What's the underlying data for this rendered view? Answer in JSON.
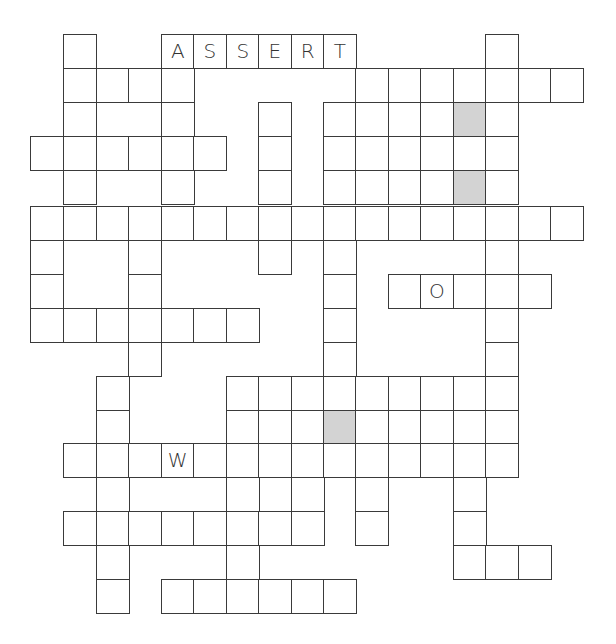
{
  "puzzle": {
    "type": "crossword",
    "columns_x": [
      30,
      63,
      96,
      128,
      161,
      193,
      226,
      258,
      291,
      323,
      355,
      388,
      420,
      453,
      485,
      518,
      550
    ],
    "rows_y": [
      34,
      68,
      102,
      136,
      170,
      206,
      240,
      274,
      308,
      342,
      376,
      410,
      443,
      477,
      511,
      545,
      579
    ],
    "cell_width": 33.5,
    "cell_height": 34.5,
    "shaded_color": "#d3d3d3",
    "border_color": "#3a3a3a",
    "rows": [
      {
        "r": 0,
        "cells": [
          {
            "c": 1
          },
          {
            "c": 4,
            "letter": "A"
          },
          {
            "c": 5,
            "letter": "S"
          },
          {
            "c": 6,
            "letter": "S"
          },
          {
            "c": 7,
            "letter": "E"
          },
          {
            "c": 8,
            "letter": "R"
          },
          {
            "c": 9,
            "letter": "T"
          },
          {
            "c": 14
          }
        ]
      },
      {
        "r": 1,
        "cells": [
          {
            "c": 1
          },
          {
            "c": 2
          },
          {
            "c": 3
          },
          {
            "c": 4
          },
          {
            "c": 10
          },
          {
            "c": 11
          },
          {
            "c": 12
          },
          {
            "c": 13
          },
          {
            "c": 14
          },
          {
            "c": 15
          },
          {
            "c": 16
          }
        ]
      },
      {
        "r": 2,
        "cells": [
          {
            "c": 1
          },
          {
            "c": 4
          },
          {
            "c": 7
          },
          {
            "c": 9
          },
          {
            "c": 10
          },
          {
            "c": 11
          },
          {
            "c": 12
          },
          {
            "c": 13,
            "shaded": true
          },
          {
            "c": 14
          }
        ]
      },
      {
        "r": 3,
        "cells": [
          {
            "c": 0
          },
          {
            "c": 1
          },
          {
            "c": 2
          },
          {
            "c": 3
          },
          {
            "c": 4
          },
          {
            "c": 5
          },
          {
            "c": 7
          },
          {
            "c": 9
          },
          {
            "c": 10
          },
          {
            "c": 11
          },
          {
            "c": 12
          },
          {
            "c": 13
          },
          {
            "c": 14
          }
        ]
      },
      {
        "r": 4,
        "cells": [
          {
            "c": 1
          },
          {
            "c": 4
          },
          {
            "c": 7
          },
          {
            "c": 9
          },
          {
            "c": 10
          },
          {
            "c": 11
          },
          {
            "c": 12
          },
          {
            "c": 13,
            "shaded": true
          },
          {
            "c": 14
          }
        ]
      },
      {
        "r": 5,
        "cells": [
          {
            "c": 0
          },
          {
            "c": 1
          },
          {
            "c": 2
          },
          {
            "c": 3
          },
          {
            "c": 4
          },
          {
            "c": 5
          },
          {
            "c": 6
          },
          {
            "c": 7
          },
          {
            "c": 8
          },
          {
            "c": 9
          },
          {
            "c": 10
          },
          {
            "c": 11
          },
          {
            "c": 12
          },
          {
            "c": 13
          },
          {
            "c": 14
          },
          {
            "c": 15
          },
          {
            "c": 16
          }
        ]
      },
      {
        "r": 6,
        "cells": [
          {
            "c": 0
          },
          {
            "c": 3
          },
          {
            "c": 7
          },
          {
            "c": 9
          },
          {
            "c": 14
          }
        ]
      },
      {
        "r": 7,
        "cells": [
          {
            "c": 0
          },
          {
            "c": 3
          },
          {
            "c": 9
          },
          {
            "c": 11
          },
          {
            "c": 12,
            "letter": "O"
          },
          {
            "c": 13
          },
          {
            "c": 14
          },
          {
            "c": 15
          }
        ]
      },
      {
        "r": 8,
        "cells": [
          {
            "c": 0
          },
          {
            "c": 1
          },
          {
            "c": 2
          },
          {
            "c": 3
          },
          {
            "c": 4
          },
          {
            "c": 5
          },
          {
            "c": 6
          },
          {
            "c": 9
          },
          {
            "c": 14
          }
        ]
      },
      {
        "r": 9,
        "cells": [
          {
            "c": 3
          },
          {
            "c": 9
          },
          {
            "c": 14
          }
        ]
      },
      {
        "r": 10,
        "cells": [
          {
            "c": 2
          },
          {
            "c": 6
          },
          {
            "c": 7
          },
          {
            "c": 8
          },
          {
            "c": 9
          },
          {
            "c": 10
          },
          {
            "c": 11
          },
          {
            "c": 12
          },
          {
            "c": 13
          },
          {
            "c": 14
          }
        ]
      },
      {
        "r": 11,
        "cells": [
          {
            "c": 2
          },
          {
            "c": 6
          },
          {
            "c": 7
          },
          {
            "c": 8
          },
          {
            "c": 9,
            "shaded": true
          },
          {
            "c": 10
          },
          {
            "c": 11
          },
          {
            "c": 12
          },
          {
            "c": 13
          },
          {
            "c": 14
          }
        ]
      },
      {
        "r": 12,
        "cells": [
          {
            "c": 1
          },
          {
            "c": 2
          },
          {
            "c": 3
          },
          {
            "c": 4,
            "letter": "W"
          },
          {
            "c": 5
          },
          {
            "c": 6
          },
          {
            "c": 7
          },
          {
            "c": 8
          },
          {
            "c": 9
          },
          {
            "c": 10
          },
          {
            "c": 11
          },
          {
            "c": 12
          },
          {
            "c": 13
          },
          {
            "c": 14
          }
        ]
      },
      {
        "r": 13,
        "cells": [
          {
            "c": 2
          },
          {
            "c": 6
          },
          {
            "c": 8
          },
          {
            "c": 10
          },
          {
            "c": 13
          }
        ]
      },
      {
        "r": 14,
        "cells": [
          {
            "c": 1
          },
          {
            "c": 2
          },
          {
            "c": 3
          },
          {
            "c": 4
          },
          {
            "c": 5
          },
          {
            "c": 6
          },
          {
            "c": 7
          },
          {
            "c": 8
          },
          {
            "c": 10
          },
          {
            "c": 13
          }
        ]
      },
      {
        "r": 15,
        "cells": [
          {
            "c": 2
          },
          {
            "c": 6
          },
          {
            "c": 13
          },
          {
            "c": 14
          },
          {
            "c": 15
          }
        ]
      },
      {
        "r": 16,
        "cells": [
          {
            "c": 2
          },
          {
            "c": 4
          },
          {
            "c": 5
          },
          {
            "c": 6
          },
          {
            "c": 7
          },
          {
            "c": 8
          },
          {
            "c": 9
          }
        ]
      }
    ]
  }
}
